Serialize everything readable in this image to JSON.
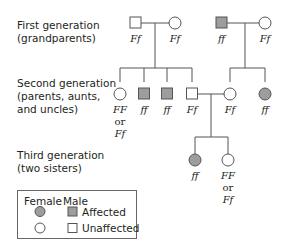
{
  "generations": [
    {
      "label_line1": "First generation",
      "label_line2": "(grandparents)",
      "label_line3": ""
    },
    {
      "label_line1": "Second generation",
      "label_line2": "(parents, aunts,",
      "label_line3": "and uncles)"
    },
    {
      "label_line1": "Third generation",
      "label_line2": "(two sisters)",
      "label_line3": ""
    }
  ],
  "individuals": {
    "g1_left_male": {
      "sex": "male",
      "affected": false,
      "genotype": "Ff"
    },
    "g1_left_female": {
      "sex": "female",
      "affected": false,
      "genotype": "Ff"
    },
    "g1_right_male": {
      "sex": "male",
      "affected": true,
      "genotype": "ff"
    },
    "g1_right_female": {
      "sex": "female",
      "affected": false,
      "genotype": "Ff"
    },
    "g2_female_1": {
      "sex": "female",
      "affected": false,
      "genotype_line1": "FF",
      "genotype_line2": "or",
      "genotype_line3": "Ff"
    },
    "g2_male_1": {
      "sex": "male",
      "affected": true,
      "genotype": "ff"
    },
    "g2_male_2": {
      "sex": "male",
      "affected": true,
      "genotype": "ff"
    },
    "g2_male_3": {
      "sex": "male",
      "affected": false,
      "genotype": "Ff"
    },
    "g2_female_2": {
      "sex": "female",
      "affected": false,
      "genotype": "Ff"
    },
    "g2_female_3": {
      "sex": "female",
      "affected": true,
      "genotype": "ff"
    },
    "g3_sister_1": {
      "sex": "female",
      "affected": true,
      "genotype": "ff"
    },
    "g3_sister_2": {
      "sex": "female",
      "affected": false,
      "genotype_line1": "FF",
      "genotype_line2": "or",
      "genotype_line3": "Ff"
    }
  },
  "legend": {
    "female_header": "Female",
    "male_header": "Male",
    "affected_label": "Affected",
    "unaffected_label": "Unaffected"
  },
  "colors": {
    "affected_fill": "#9d9d9d",
    "unaffected_fill": "#ffffff",
    "line": "#555555",
    "text": "#231f20"
  }
}
